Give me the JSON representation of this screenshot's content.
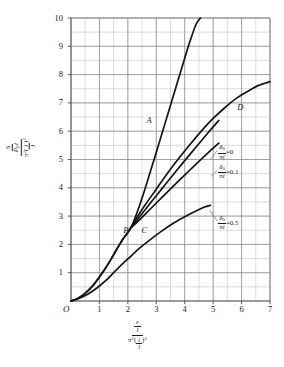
{
  "chart_data": {
    "type": "line",
    "title": "",
    "subtitle": "",
    "xlabel": "(ε/l) / (π²(i/l)²)",
    "ylabel": "(S/(P_E l)) / (π²(i/l)²)",
    "xlim": [
      0,
      7
    ],
    "ylim": [
      0,
      10
    ],
    "xticks": [
      0,
      1,
      2,
      3,
      4,
      5,
      6,
      7
    ],
    "xticklabels": [
      "O",
      "1",
      "2",
      "3",
      "4",
      "5",
      "6",
      "7"
    ],
    "yticks": [
      1,
      2,
      3,
      4,
      5,
      6,
      7,
      8,
      9,
      10
    ],
    "yticklabels": [
      "1",
      "2",
      "3",
      "4",
      "5",
      "6",
      "7",
      "8",
      "9",
      "10"
    ],
    "grid": true,
    "minor_grid": true,
    "minor_grid_x_step": 0.5,
    "minor_grid_y_step": 0.5,
    "legend_position": "inline-annotations",
    "series": [
      {
        "name": "A",
        "label": "A",
        "label_x": 2.66,
        "label_y": 6.55,
        "points": [
          [
            0.0,
            0.0
          ],
          [
            0.2,
            0.07
          ],
          [
            0.4,
            0.2
          ],
          [
            0.6,
            0.37
          ],
          [
            0.8,
            0.58
          ],
          [
            1.0,
            0.85
          ],
          [
            1.2,
            1.14
          ],
          [
            1.4,
            1.46
          ],
          [
            1.6,
            1.81
          ],
          [
            1.8,
            2.15
          ],
          [
            2.0,
            2.42
          ],
          [
            2.1,
            2.58
          ],
          [
            2.2,
            2.8
          ],
          [
            2.4,
            3.34
          ],
          [
            2.6,
            3.95
          ],
          [
            2.8,
            4.6
          ],
          [
            3.0,
            5.25
          ],
          [
            3.2,
            5.92
          ],
          [
            3.4,
            6.58
          ],
          [
            3.6,
            7.25
          ],
          [
            3.8,
            7.92
          ],
          [
            4.0,
            8.58
          ],
          [
            4.2,
            9.22
          ],
          [
            4.4,
            9.78
          ],
          [
            4.55,
            10.0
          ]
        ]
      },
      {
        "name": "D",
        "label": "D",
        "label_x": 5.85,
        "label_y": 7.0,
        "points": [
          [
            0.0,
            0.0
          ],
          [
            0.2,
            0.07
          ],
          [
            0.4,
            0.2
          ],
          [
            0.6,
            0.37
          ],
          [
            0.8,
            0.58
          ],
          [
            1.0,
            0.85
          ],
          [
            1.2,
            1.14
          ],
          [
            1.4,
            1.46
          ],
          [
            1.6,
            1.81
          ],
          [
            1.8,
            2.15
          ],
          [
            2.0,
            2.42
          ],
          [
            2.1,
            2.58
          ],
          [
            2.3,
            2.92
          ],
          [
            2.6,
            3.38
          ],
          [
            3.0,
            3.95
          ],
          [
            3.4,
            4.52
          ],
          [
            3.8,
            5.05
          ],
          [
            4.2,
            5.55
          ],
          [
            4.6,
            6.02
          ],
          [
            5.0,
            6.45
          ],
          [
            5.4,
            6.82
          ],
          [
            5.8,
            7.15
          ],
          [
            6.2,
            7.4
          ],
          [
            6.6,
            7.62
          ],
          [
            7.0,
            7.75
          ]
        ]
      },
      {
        "name": "delta0-over-pi-i = 0",
        "annotation": "0",
        "anno_x": 5.18,
        "anno_y": 5.32,
        "leader_to_x": 4.92,
        "leader_to_y": 5.02,
        "points": [
          [
            2.1,
            2.58
          ],
          [
            2.4,
            2.96
          ],
          [
            2.8,
            3.47
          ],
          [
            3.2,
            3.97
          ],
          [
            3.6,
            4.47
          ],
          [
            4.0,
            4.96
          ],
          [
            4.4,
            5.44
          ],
          [
            4.8,
            5.92
          ],
          [
            5.2,
            6.38
          ]
        ]
      },
      {
        "name": "delta0-over-pi-i = 0.1",
        "annotation": "0.1",
        "anno_x": 5.18,
        "anno_y": 4.62,
        "leader_to_x": 4.92,
        "leader_to_y": 4.4,
        "points": [
          [
            2.1,
            2.58
          ],
          [
            2.4,
            2.86
          ],
          [
            2.8,
            3.26
          ],
          [
            3.2,
            3.66
          ],
          [
            3.6,
            4.06
          ],
          [
            4.0,
            4.45
          ],
          [
            4.4,
            4.84
          ],
          [
            4.8,
            5.22
          ],
          [
            5.2,
            5.58
          ]
        ]
      },
      {
        "name": "delta0-over-pi-i = 0.5",
        "annotation": "0.5",
        "anno_x": 5.18,
        "anno_y": 2.82,
        "leader_to_x": 4.88,
        "leader_to_y": 3.2,
        "points": [
          [
            0.0,
            0.0
          ],
          [
            0.3,
            0.1
          ],
          [
            0.6,
            0.25
          ],
          [
            0.9,
            0.45
          ],
          [
            1.2,
            0.7
          ],
          [
            1.5,
            1.0
          ],
          [
            1.8,
            1.3
          ],
          [
            2.1,
            1.58
          ],
          [
            2.4,
            1.86
          ],
          [
            2.8,
            2.18
          ],
          [
            3.2,
            2.48
          ],
          [
            3.6,
            2.75
          ],
          [
            4.0,
            2.98
          ],
          [
            4.4,
            3.18
          ],
          [
            4.7,
            3.32
          ],
          [
            4.9,
            3.38
          ]
        ]
      }
    ],
    "point_labels": [
      {
        "name": "B",
        "label": "B",
        "x": 1.98,
        "y": 2.5
      },
      {
        "name": "C",
        "label": "C",
        "x": 2.62,
        "y": 2.5
      }
    ],
    "annotation_prefix_numerator": "δ",
    "annotation_prefix_numerator_sub": "0",
    "annotation_prefix_denominator_1": "π",
    "annotation_prefix_denominator_2": "i",
    "annotation_equals": "="
  },
  "axes": {
    "x_title": {
      "numerator_symbol": "ε",
      "numerator_over": "l",
      "denominator_pi": "π",
      "denominator_pi_exp": "2",
      "denominator_frac_num": "i",
      "denominator_frac_den": "l",
      "denominator_exp": "2"
    },
    "y_title": {
      "numerator_S": "S",
      "numerator_P": "P",
      "numerator_P_sub": "E",
      "numerator_l": "l",
      "denominator_pi": "π",
      "denominator_pi_exp": "2",
      "denominator_frac_num": "i",
      "denominator_frac_den": "l",
      "denominator_exp": "2"
    }
  },
  "style": {
    "curve_color": "#141414",
    "grid_major_color": "#8a8a8a",
    "grid_minor_color": "#b8b8b8",
    "axis_color": "#4a4a4a",
    "background": "#ffffff",
    "leader_color": "#555555"
  }
}
